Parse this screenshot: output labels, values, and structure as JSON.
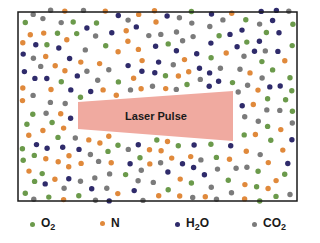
{
  "diagram": {
    "laser_label": "Laser Pulse",
    "colors": {
      "O2": "#6b9a4b",
      "N": "#e0893b",
      "H2O": "#2f2b6b",
      "CO2": "#7b7b7b",
      "laser": "#f0aaa0",
      "border": "#1a1a1a"
    },
    "frame": {
      "x": 18,
      "y": 12,
      "width": 279,
      "height": 189
    },
    "laser": {
      "points": "78,102 233,91 233,141 78,129"
    }
  },
  "legend": {
    "items": [
      {
        "key": "O2",
        "base": "O",
        "sub": "2",
        "suffix": "",
        "x": 30,
        "y": 216
      },
      {
        "key": "N",
        "base": "N",
        "sub": "",
        "suffix": "",
        "x": 100,
        "y": 216
      },
      {
        "key": "H2O",
        "base": "H",
        "sub": "2",
        "suffix": "O",
        "x": 175,
        "y": 216
      },
      {
        "key": "CO2",
        "base": "CO",
        "sub": "2",
        "suffix": "",
        "x": 252,
        "y": 216
      }
    ]
  }
}
